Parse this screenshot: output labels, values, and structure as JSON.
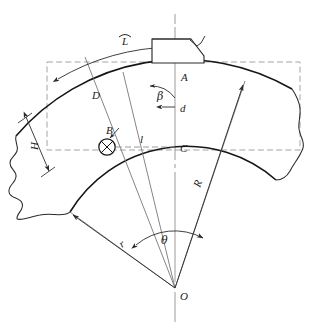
{
  "diagram": {
    "type": "engineering-drawing",
    "background_color": "#ffffff",
    "line_color": "#2b2b2b",
    "heavy_line_color": "#111111",
    "construction_line_color": "#8a8a8a",
    "dashed_line_color": "#999999"
  },
  "labels": {
    "arc_length": "L",
    "arc_length_symbol": "arc-hat",
    "point_a": "A",
    "point_b": "B",
    "point_c": "C",
    "point_o": "O",
    "chord_d_upper": "D",
    "height_h": "H",
    "distance_l": "l",
    "diameter_d": "d",
    "angle_beta": "β",
    "angle_theta": "θ",
    "radius_outer": "R",
    "radius_inner": "r"
  },
  "geometry": {
    "center": {
      "x": 175,
      "y": 288,
      "name": "O"
    },
    "point_a": {
      "x": 175,
      "y": 69
    },
    "point_b": {
      "x": 107,
      "y": 147
    },
    "point_c": {
      "x": 175,
      "y": 150
    },
    "outer_radius_px": 219,
    "inner_radius_px": 136,
    "angle_theta_deg": 76,
    "angle_beta_deg": 38
  },
  "annotations": {
    "bounding_box": "dashed rectangle enclosing blank area",
    "break_edges": "freehand break lines on left and right ends",
    "axis": "vertical centerline through A, C and O",
    "hole_symbol": "crossed-circle at point B"
  }
}
